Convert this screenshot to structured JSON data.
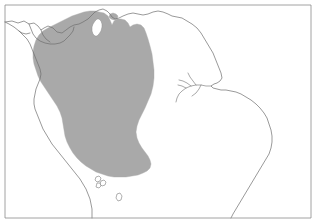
{
  "figure": {
    "type": "distribution-range-map",
    "region": "Northern South America",
    "background_color": "#ffffff",
    "frame": {
      "stroke_color": "#8c8c8c",
      "stroke_width": 0.8,
      "x": 4.5,
      "y": 4.5,
      "width": 306,
      "height": 214
    },
    "coastline": {
      "stroke_color": "#6e6e6e",
      "stroke_width": 0.7,
      "fill": "none"
    },
    "range_polygon": {
      "label": "shaded distribution range",
      "fill_color": "#a9a9a9",
      "stroke_color": "#a9a9a9",
      "stroke_width": 0.4,
      "hole_label": "Lake Maracaibo",
      "hole_fill": "#ffffff"
    },
    "islands": {
      "label": "offshore island outlines",
      "stroke_color": "#7a7a7a",
      "fill": "#ffffff"
    }
  },
  "geometry": {
    "frame_rect": "M 5 5 L 311 5 L 311 218 L 5 218 Z",
    "coast_main": "M 5 22 L 12 21 L 18 23 L 24 21 L 29 24 L 34 23 L 38 26 L 41 30 L 44 28 L 48 26 L 53 28 L 57 32 L 62 33 L 66 30 L 70 27 L 74 25 L 79 24 L 83 22 L 88 19 L 92 15 L 95 12 L 99 10 L 103 9 L 107 11 L 110 14 L 112 17 L 115 19 L 119 18 L 123 16 L 128 14 L 133 13 L 138 14 L 143 15 L 148 14 L 153 12 L 158 11 L 163 12 L 168 14 L 172 16 L 177 17 L 182 18 L 187 21 L 192 24 L 197 28 L 201 33 L 204 38 L 207 43 L 210 48 L 213 53 L 215 58 L 217 63 L 219 68 L 221 73 L 222 78 L 220 81 L 217 83 L 214 84 L 211 86 L 213 88 L 217 89 L 221 90 L 226 90 L 231 91 L 236 92 L 241 94 L 246 97 L 251 100 L 256 104 L 260 108 L 264 113 L 267 118 L 269 124 L 271 130 L 272 136 L 272 142 L 271 148 L 269 154 L 266 159 L 263 164 L 260 169 L 257 174 L 254 179 L 251 184 L 248 189 L 245 194 L 242 199 L 239 204 L 236 209 L 233 214 L 231 218",
    "coast_pacific": "M 5 22 L 9 24 L 14 27 L 19 31 L 23 35 L 27 39 L 30 44 L 32 49 L 34 54 L 36 59 L 38 64 L 40 69 L 41 74 L 40 79 L 38 84 L 36 89 L 35 94 L 34 99 L 34 104 L 35 109 L 37 114 L 39 119 L 41 124 L 43 129 L 46 134 L 49 139 L 52 144 L 56 149 L 60 154 L 64 159 L 68 164 L 72 169 L 76 174 L 80 179 L 83 184 L 86 189 L 88 194 L 90 199 L 91 204 L 92 209 L 92 214 L 92 218",
    "coast_inland_1": "M 29 24 L 31 29 L 33 34 L 36 38 L 40 41 L 45 43 L 50 44 L 55 44 L 60 43 L 64 41 L 67 38 L 70 35 L 73 31 L 74 27",
    "coast_inland_2": "M 41 30 L 43 35 L 46 39 L 50 42",
    "coast_inland_3": "M 19 31 L 22 33 L 26 34 L 30 33",
    "river_amazon_main": "M 211 86 L 206 86 L 201 85 L 196 85 L 191 86 L 186 88 L 182 91 L 179 94 L 177 98 L 176 102",
    "river_branch_1": "M 196 85 L 193 81 L 190 77 L 188 73",
    "river_branch_2": "M 201 85 L 199 89 L 196 93 L 192 96",
    "river_branch_3": "M 191 86 L 187 83 L 183 81 L 179 80",
    "river_branch_4": "M 186 88 L 182 86 L 178 85",
    "range_outer": "M 99 12 L 104 13 L 108 16 L 110 20 L 112 25 L 114 21 L 117 19 L 121 19 L 125 20 L 128 23 L 130 27 L 133 25 L 137 24 L 141 25 L 144 28 L 146 33 L 148 39 L 150 46 L 152 54 L 153 62 L 154 70 L 154 78 L 153 86 L 151 94 L 148 101 L 145 108 L 142 114 L 139 120 L 137 126 L 136 132 L 137 138 L 139 143 L 142 148 L 145 152 L 148 156 L 150 160 L 151 164 L 150 168 L 147 171 L 143 173 L 138 175 L 132 176 L 126 177 L 120 177 L 114 177 L 108 176 L 102 174 L 96 172 L 91 169 L 86 166 L 81 162 L 77 158 L 73 153 L 70 148 L 67 142 L 65 136 L 64 130 L 63 124 L 62 118 L 60 112 L 57 106 L 53 100 L 49 94 L 45 88 L 41 82 L 38 76 L 36 70 L 34 64 L 33 58 L 33 52 L 34 46 L 36 40 L 39 35 L 43 31 L 48 28 L 54 25 L 60 22 L 66 19 L 72 16 L 78 14 L 84 12 L 90 11 L 95 11 Z",
    "range_hole_maracaibo": "M 99 19 L 101 21 L 102 24 L 102 27 L 101 31 L 99 34 L 97 36 L 95 36 L 93 34 L 92 31 L 92 27 L 93 24 L 95 21 L 97 19 Z",
    "range_notch_top": "M 110 14 L 113 13 L 116 14 L 118 16 L 117 19 L 114 20 L 111 19 L 109 17 Z",
    "island_1": "M 96 177 L 99 176 L 101 178 L 100 181 L 97 182 L 95 180 Z",
    "island_2": "M 101 181 L 104 180 L 106 182 L 105 185 L 102 186 L 100 184 Z",
    "island_3": "M 97 183 L 100 183 L 101 186 L 99 188 L 96 187 Z",
    "island_4": "M 117 194 L 120 193 L 122 196 L 121 200 L 118 201 L 116 198 Z"
  },
  "labels": {
    "title": "",
    "caption": ""
  }
}
